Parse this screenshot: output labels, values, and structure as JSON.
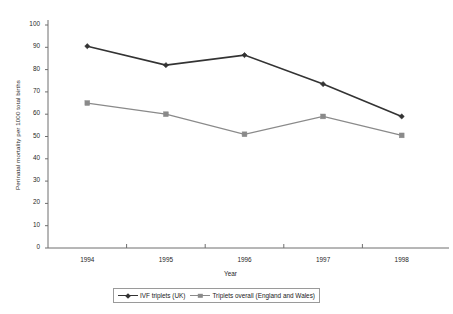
{
  "chart_data": {
    "type": "line",
    "title": "",
    "xlabel": "Year",
    "ylabel": "Perinatal mortality per 1000 total births",
    "categories": [
      "1994",
      "1995",
      "1996",
      "1997",
      "1998"
    ],
    "ylim": [
      0,
      100
    ],
    "yticks": [
      "0",
      "10",
      "20",
      "30",
      "40",
      "50",
      "60",
      "70",
      "80",
      "90",
      "100"
    ],
    "grid": false,
    "legend_position": "bottom",
    "series": [
      {
        "name": "IVF triplets (UK)",
        "marker": "diamond",
        "color": "#333333",
        "values": [
          90.5,
          82.0,
          86.5,
          73.5,
          59.0
        ]
      },
      {
        "name": "Triplets overall (England and Wales)",
        "marker": "square",
        "color": "#8a8a8a",
        "values": [
          65.0,
          60.0,
          51.0,
          59.0,
          50.5
        ]
      }
    ]
  },
  "axis": {
    "line_color": "#6e6e6e"
  }
}
